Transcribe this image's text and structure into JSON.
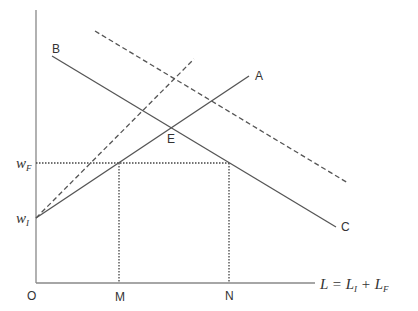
{
  "diagram": {
    "type": "economics-labor-market",
    "axes": {
      "origin_label": "O",
      "x_axis_label": {
        "main": "L = L",
        "sub1": "I",
        "plus": " + L",
        "sub2": "F"
      },
      "y_ticks": [
        {
          "main": "w",
          "sub": "F"
        },
        {
          "main": "w",
          "sub": "I"
        }
      ],
      "x_ticks": [
        "M",
        "N"
      ]
    },
    "curves": [
      {
        "id": "A",
        "label": "A",
        "style": "solid"
      },
      {
        "id": "BC",
        "label_start": "B",
        "label_end": "C",
        "style": "solid"
      },
      {
        "id": "dashed-supply",
        "label": "",
        "style": "dashed"
      },
      {
        "id": "dashed-demand",
        "label": "",
        "style": "dashed"
      }
    ],
    "points": [
      {
        "label": "E"
      }
    ],
    "colors": {
      "line": "#555555",
      "text": "#333333"
    }
  }
}
